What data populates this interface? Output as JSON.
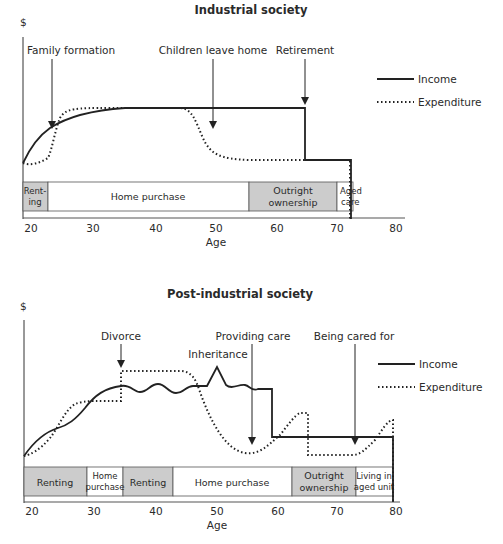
{
  "top": {
    "title": "Industrial society",
    "y_axis_label": "$",
    "x_axis_label": "Age",
    "ticks": [
      "20",
      "30",
      "40",
      "50",
      "60",
      "70",
      "80"
    ],
    "legend": {
      "income": "Income",
      "expenditure": "Expenditure"
    },
    "events": [
      {
        "label": "Family formation"
      },
      {
        "label": "Children leave home"
      },
      {
        "label": "Retirement"
      }
    ],
    "bands": [
      {
        "line1": "Rent-",
        "line2": "ing",
        "shaded": true
      },
      {
        "line1": "Home purchase",
        "shaded": false
      },
      {
        "line1": "Outright",
        "line2": "ownership",
        "shaded": true
      },
      {
        "line1": "Aged",
        "line2": "care",
        "shaded": false
      }
    ]
  },
  "bottom": {
    "title": "Post-industrial society",
    "y_axis_label": "$",
    "x_axis_label": "Age",
    "ticks": [
      "20",
      "30",
      "40",
      "50",
      "60",
      "70",
      "80"
    ],
    "legend": {
      "income": "Income",
      "expenditure": "Expenditure"
    },
    "events": [
      {
        "label": "Divorce"
      },
      {
        "label": "Inheritance"
      },
      {
        "label": "Providing care"
      },
      {
        "label": "Being cared for"
      }
    ],
    "bands": [
      {
        "line1": "Renting",
        "shaded": true
      },
      {
        "line1": "Home",
        "line2": "purchase",
        "shaded": false
      },
      {
        "line1": "Renting",
        "shaded": true
      },
      {
        "line1": "Home purchase",
        "shaded": false
      },
      {
        "line1": "Outright",
        "line2": "ownership",
        "shaded": true
      },
      {
        "line1": "Living in",
        "line2": "aged unit",
        "shaded": false
      }
    ]
  },
  "colors": {
    "line": "#222222",
    "band_shaded": "#cccccc",
    "band_border": "#555555"
  }
}
